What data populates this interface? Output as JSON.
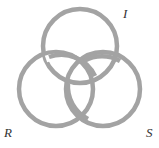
{
  "diagram": {
    "ring_color": "#a3a3a3",
    "labels": {
      "top": "I",
      "left": "R",
      "right": "S"
    }
  }
}
